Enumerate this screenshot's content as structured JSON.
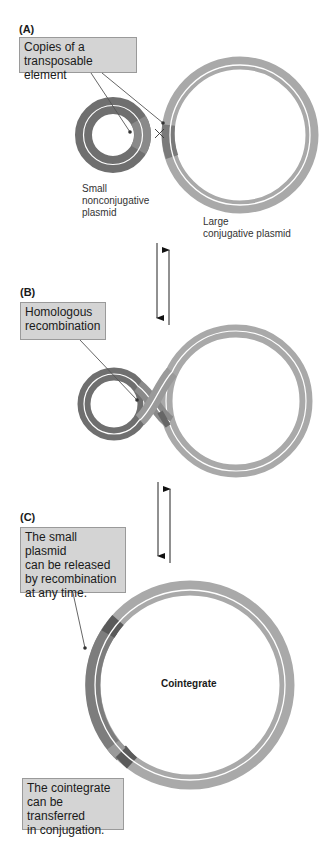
{
  "panels": [
    {
      "id": "A",
      "label": "(A)",
      "callout": [
        "Copies of a",
        "transposable element"
      ],
      "captions": {
        "small_plasmid": [
          "Small",
          "nonconjugative",
          "plasmid"
        ],
        "large_plasmid": [
          "Large",
          "conjugative plasmid"
        ]
      },
      "crossover_symbol": "×"
    },
    {
      "id": "B",
      "label": "(B)",
      "callout": [
        "Homologous",
        "recombination"
      ]
    },
    {
      "id": "C",
      "label": "(C)",
      "callout": [
        "The small plasmid",
        "can be released",
        "by recombination",
        "at any time."
      ],
      "center_label": "Cointegrate",
      "bottom_callout": [
        "The cointegrate",
        "can be transferred",
        "in conjugation."
      ]
    }
  ],
  "arrows": [
    {
      "between": "A-B",
      "directions": [
        "down",
        "up"
      ]
    },
    {
      "between": "B-C",
      "directions": [
        "down",
        "up"
      ]
    }
  ],
  "colors": {
    "small_plasmid": "#6f6f6f",
    "large_plasmid": "#a9a9a9",
    "transposable_element": "#8a8a8a",
    "te_dark": "#555555",
    "callout_bg": "#d4d4d4",
    "callout_border": "#9a9a9a"
  }
}
